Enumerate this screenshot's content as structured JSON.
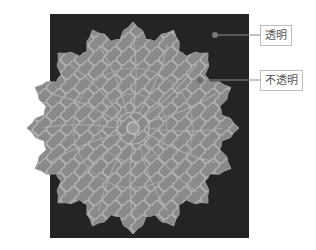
{
  "figure": {
    "background_color": "#242424",
    "medallion_fill": "#8a8a8a",
    "medallion_line": "#b4b4b4",
    "callout_line_color": "#8c8c8c"
  },
  "callouts": [
    {
      "label": "透明",
      "meaning": "transparent area"
    },
    {
      "label": "不透明",
      "meaning": "opaque area"
    }
  ]
}
